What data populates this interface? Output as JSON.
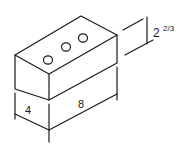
{
  "diagram": {
    "stroke_color": "#1a1a1a",
    "background": "#ffffff",
    "holes": 3,
    "dimensions": {
      "width": "4",
      "length": "8",
      "height_whole": "2",
      "height_fraction": "2/3"
    }
  }
}
